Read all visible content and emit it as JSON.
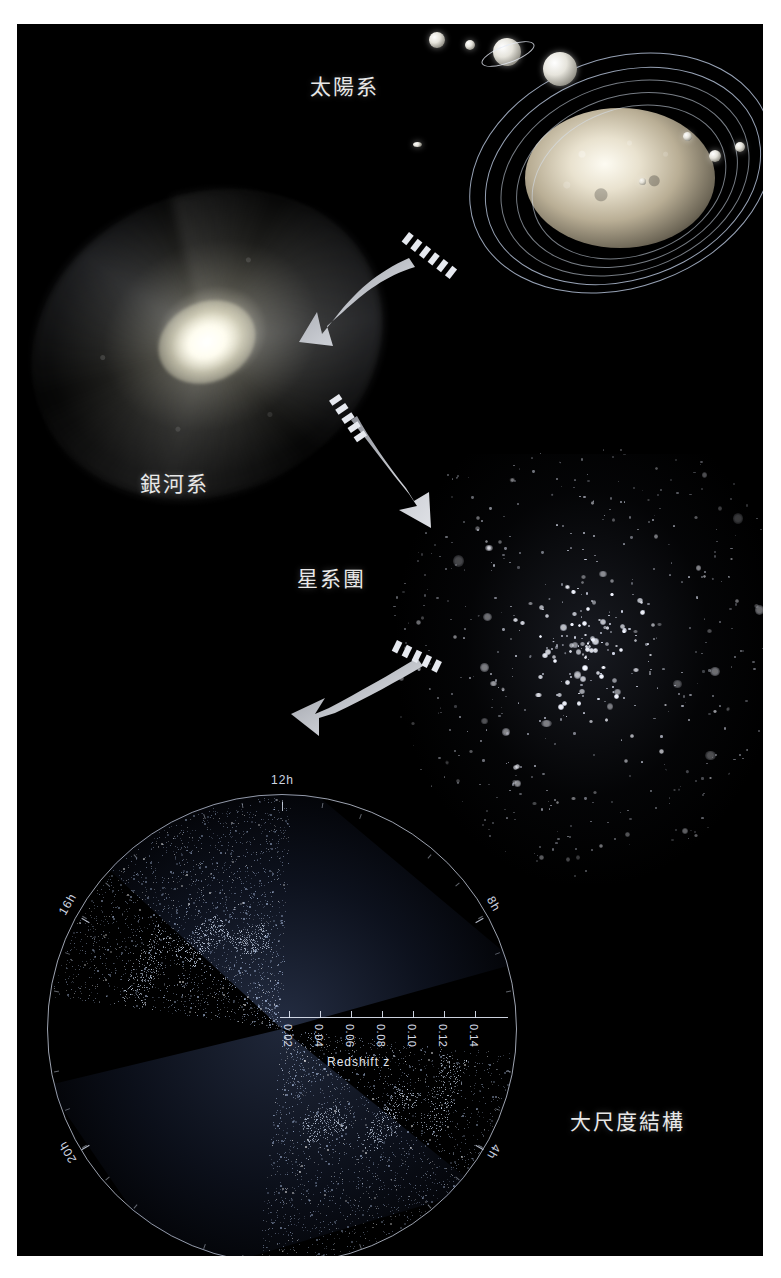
{
  "figure": {
    "title_visible": false,
    "background": "#000000",
    "page_background": "#ffffff",
    "label_color": "#e8e8e8",
    "arrow_color": "#b9bcc2"
  },
  "panels": [
    {
      "id": "solar-system",
      "label": "太陽系",
      "label_pos": {
        "x": 310,
        "y": 70
      },
      "description_visible": false
    },
    {
      "id": "galaxy",
      "label": "銀河系",
      "label_pos": {
        "x": 140,
        "y": 467
      }
    },
    {
      "id": "galaxy-cluster",
      "label": "星系團",
      "label_pos": {
        "x": 297,
        "y": 562
      }
    },
    {
      "id": "large-scale-structure",
      "label": "大尺度結構",
      "label_pos": {
        "x": 570,
        "y": 1105
      }
    }
  ],
  "arrows": [
    {
      "id": "arrow-solar-to-galaxy",
      "from": "solar-system",
      "to": "galaxy"
    },
    {
      "id": "arrow-galaxy-to-cluster",
      "from": "galaxy",
      "to": "galaxy-cluster"
    },
    {
      "id": "arrow-cluster-to-lss",
      "from": "galaxy-cluster",
      "to": "large-scale-structure"
    }
  ],
  "chart_data": {
    "type": "scatter",
    "title": "",
    "xlabel": "Redshift z",
    "ylabel": "",
    "projection": "polar-wedge",
    "grid": false,
    "legend": false,
    "axis_label": "Redshift z",
    "redshift_ticks": [
      "0.02",
      "0.04",
      "0.06",
      "0.08",
      "0.10",
      "0.12",
      "0.14"
    ],
    "redshift_range": [
      0.0,
      0.15
    ],
    "ra_labels": [
      "12h",
      "16h",
      "20h",
      "0h",
      "4h",
      "8h"
    ],
    "ra_label_positions": [
      {
        "label": "12h",
        "angle_deg": 90
      },
      {
        "label": "16h",
        "angle_deg": 150
      },
      {
        "label": "20h",
        "angle_deg": 210
      },
      {
        "label": "0h",
        "angle_deg": 270
      },
      {
        "label": "4h",
        "angle_deg": 330
      },
      {
        "label": "8h",
        "angle_deg": 30
      }
    ]
  }
}
